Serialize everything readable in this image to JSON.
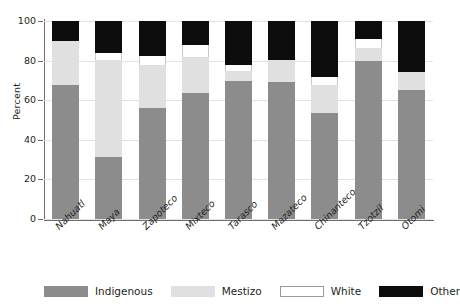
{
  "chart_data": {
    "type": "bar",
    "stacked": true,
    "title": "",
    "xlabel": "",
    "ylabel": "Percent",
    "ylim": [
      0,
      100
    ],
    "yticks": [
      0,
      20,
      40,
      60,
      80,
      100
    ],
    "ytick_labels": [
      "0",
      "20",
      "40",
      "60",
      "80",
      "100"
    ],
    "grid": true,
    "legend_position": "bottom",
    "categories": [
      "Nahuatl",
      "Maya",
      "Zapoteco",
      "Mixteco",
      "Tarasco",
      "Mazateco",
      "Chinanteco",
      "Tzotzil",
      "Otomi"
    ],
    "series": [
      {
        "name": "Indigenous",
        "color": "#8c8c8c",
        "values": [
          67.5,
          31.5,
          56.0,
          63.5,
          69.5,
          69.0,
          53.5,
          80.0,
          65.0
        ]
      },
      {
        "name": "Mestizo",
        "color": "#e0e0e0",
        "values": [
          22.5,
          49.0,
          22.0,
          18.5,
          5.5,
          11.5,
          14.0,
          6.5,
          9.5
        ]
      },
      {
        "name": "White",
        "color": "#ffffff",
        "values": [
          0.0,
          3.5,
          4.5,
          6.0,
          3.0,
          0.0,
          4.0,
          4.5,
          0.0
        ]
      },
      {
        "name": "Other",
        "color": "#0d0d0d",
        "values": [
          10.0,
          16.0,
          17.5,
          12.0,
          22.0,
          19.5,
          28.5,
          9.0,
          25.5
        ]
      }
    ]
  },
  "legend": {
    "items": [
      {
        "label": "Indigenous",
        "swatch": "swatch-indigenous"
      },
      {
        "label": "Mestizo",
        "swatch": "swatch-mestizo"
      },
      {
        "label": "White",
        "swatch": "swatch-white"
      },
      {
        "label": "Other",
        "swatch": "swatch-other"
      }
    ]
  }
}
